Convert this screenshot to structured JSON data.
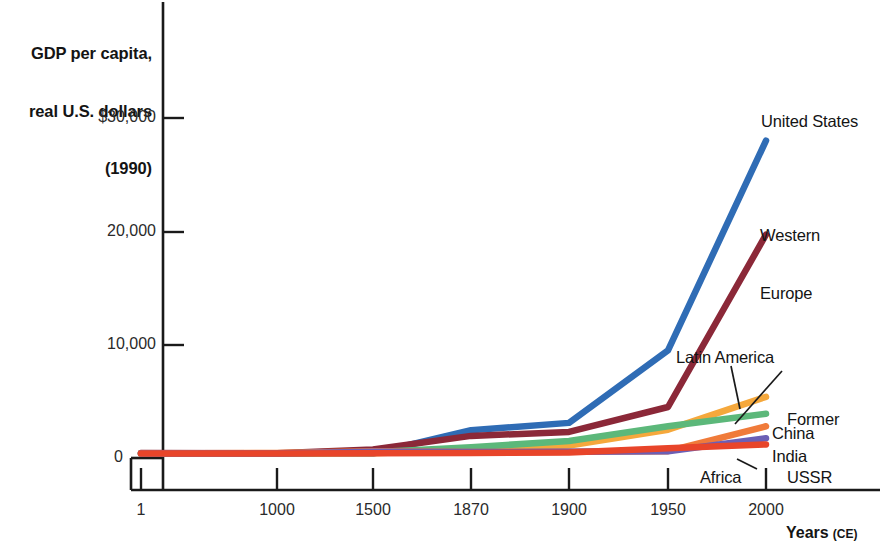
{
  "chart_data": {
    "type": "line",
    "title": "",
    "ylabel": "GDP per capita,\nreal U.S. dollars\n(1990)",
    "ylabel_lines": [
      "GDP per capita,",
      "real U.S. dollars",
      "(1990)"
    ],
    "xlabel": "Years",
    "xlabel_suffix": "(CE)",
    "x": [
      1,
      1000,
      1500,
      1870,
      1900,
      1950,
      2000
    ],
    "xtick_labels": [
      "1",
      "1000",
      "1500",
      "1870",
      "1900",
      "1950",
      "2000"
    ],
    "ytick_labels": [
      "$30,000",
      "20,000",
      "10,000",
      "0"
    ],
    "ytick_values": [
      30000,
      20000,
      10000,
      0
    ],
    "ylim": [
      0,
      32000
    ],
    "grid": false,
    "legend_position": "inline-right",
    "series": [
      {
        "name": "United States",
        "color": "#2f6cb5",
        "values": [
          400,
          400,
          400,
          2450,
          3100,
          9500,
          28000
        ]
      },
      {
        "name": "Western Europe",
        "color": "#8b2838",
        "values": [
          450,
          420,
          750,
          1950,
          2300,
          4500,
          19700
        ]
      },
      {
        "name": "Latin America",
        "color": "#f5a83c",
        "values": [
          400,
          400,
          420,
          700,
          1100,
          2500,
          5400
        ]
      },
      {
        "name": "Former USSR",
        "color": "#5cb87a",
        "values": [
          400,
          400,
          500,
          950,
          1500,
          2800,
          3900
        ]
      },
      {
        "name": "China",
        "color": "#f07b3a",
        "values": [
          400,
          450,
          600,
          530,
          550,
          600,
          2800
        ]
      },
      {
        "name": "India",
        "color": "#6b5fb5",
        "values": [
          400,
          400,
          550,
          530,
          550,
          600,
          1750
        ]
      },
      {
        "name": "Africa",
        "color": "#e8452a",
        "values": [
          400,
          400,
          410,
          450,
          480,
          850,
          1200
        ]
      }
    ],
    "annotations": [
      {
        "text": "Latin America",
        "leader": true
      },
      {
        "text": "Former USSR",
        "leader": true
      },
      {
        "text": "Africa",
        "leader": true
      }
    ]
  },
  "axis": {
    "ytitle_line1": "GDP per capita,",
    "ytitle_line2": "real U.S. dollars",
    "ytitle_line3": "(1990)",
    "yticks": [
      "$30,000",
      "20,000",
      "10,000",
      "0"
    ],
    "xticks": [
      "1",
      "1000",
      "1500",
      "1870",
      "1900",
      "1950",
      "2000"
    ],
    "xcaption": "Years",
    "xcaption_era": "(CE)"
  },
  "labels": {
    "united_states": "United States",
    "western_europe_l1": "Western",
    "western_europe_l2": "Europe",
    "latin_america": "Latin America",
    "former_ussr_l1": "Former",
    "former_ussr_l2": "USSR",
    "china": "China",
    "india": "India",
    "africa": "Africa"
  },
  "colors": {
    "united_states": "#2f6cb5",
    "western_europe": "#8b2838",
    "latin_america": "#f5a83c",
    "former_ussr": "#5cb87a",
    "china": "#f07b3a",
    "india": "#6b5fb5",
    "africa": "#e8452a",
    "axis": "#1a1a1a",
    "background": "#ffffff"
  }
}
